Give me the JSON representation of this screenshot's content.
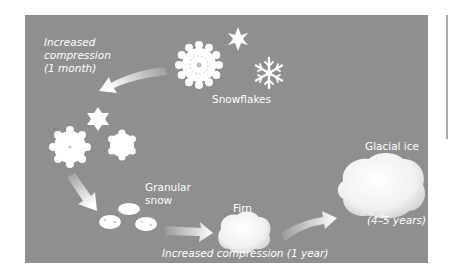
{
  "diagram": {
    "background_color": "#8f8f8f",
    "text_color": "#ffffff",
    "stages": [
      {
        "id": "snowflakes",
        "label": "Snowflakes"
      },
      {
        "id": "granular_snow",
        "label_line1": "Granular",
        "label_line2": "snow"
      },
      {
        "id": "firn",
        "label": "Firn"
      },
      {
        "id": "glacial_ice",
        "label": "Glacial ice",
        "duration": "(4–5 years)"
      }
    ],
    "transitions": [
      {
        "from": "snowflakes",
        "to": "partially-compressed flakes",
        "line1": "Increased",
        "line2": "compression",
        "line3": "(1 month)"
      },
      {
        "from": "partially-compressed flakes",
        "to": "granular_snow",
        "label": ""
      },
      {
        "from": "granular_snow",
        "to": "firn",
        "label": "Increased compression (1 year)"
      },
      {
        "from": "firn",
        "to": "glacial_ice",
        "label": ""
      }
    ]
  }
}
